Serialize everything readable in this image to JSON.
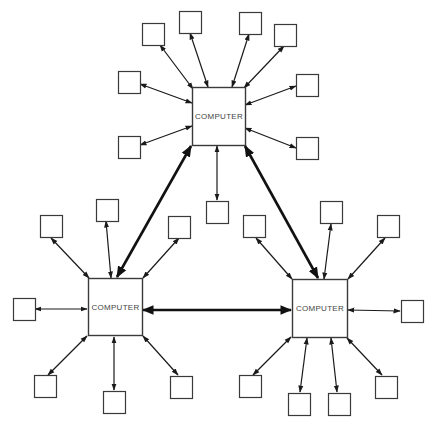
{
  "diagram": {
    "type": "distributed-computer-network",
    "colors": {
      "stroke": "#3a3a3a",
      "link": "#1a1a1a",
      "background": "#ffffff"
    },
    "computers": [
      {
        "id": "top",
        "label": "COMPUTER",
        "x": 192,
        "y": 87,
        "w": 53,
        "h": 58
      },
      {
        "id": "left",
        "label": "COMPUTER",
        "x": 88,
        "y": 278,
        "w": 54,
        "h": 57
      },
      {
        "id": "right",
        "label": "COMPUTER",
        "x": 292,
        "y": 279,
        "w": 55,
        "h": 58
      }
    ],
    "terminals": [
      {
        "hub": "top",
        "x": 142,
        "y": 23,
        "ax": 160,
        "ay": 45,
        "bx": 193,
        "by": 89
      },
      {
        "hub": "top",
        "x": 179,
        "y": 11,
        "ax": 190,
        "ay": 33,
        "bx": 208,
        "by": 87
      },
      {
        "hub": "top",
        "x": 239,
        "y": 12,
        "ax": 249,
        "ay": 34,
        "bx": 232,
        "by": 87
      },
      {
        "hub": "top",
        "x": 274,
        "y": 24,
        "ax": 284,
        "ay": 46,
        "bx": 244,
        "by": 88
      },
      {
        "hub": "top",
        "x": 118,
        "y": 71,
        "ax": 140,
        "ay": 84,
        "bx": 192,
        "by": 103
      },
      {
        "hub": "top",
        "x": 118,
        "y": 136,
        "ax": 140,
        "ay": 145,
        "bx": 192,
        "by": 126
      },
      {
        "hub": "top",
        "x": 296,
        "y": 74,
        "ax": 296,
        "ay": 86,
        "bx": 245,
        "by": 105
      },
      {
        "hub": "top",
        "x": 296,
        "y": 137,
        "ax": 296,
        "ay": 148,
        "bx": 245,
        "by": 128
      },
      {
        "hub": "top",
        "x": 206,
        "y": 201,
        "ax": 217,
        "ay": 200,
        "bx": 217,
        "by": 146
      },
      {
        "hub": "left",
        "x": 40,
        "y": 215,
        "ax": 51,
        "ay": 238,
        "bx": 89,
        "by": 278
      },
      {
        "hub": "left",
        "x": 96,
        "y": 199,
        "ax": 106,
        "ay": 221,
        "bx": 111,
        "by": 278
      },
      {
        "hub": "left",
        "x": 168,
        "y": 216,
        "ax": 179,
        "ay": 238,
        "bx": 143,
        "by": 278
      },
      {
        "hub": "left",
        "x": 13,
        "y": 298,
        "ax": 35,
        "ay": 309,
        "bx": 87,
        "by": 309
      },
      {
        "hub": "left",
        "x": 34,
        "y": 375,
        "ax": 48,
        "ay": 375,
        "bx": 87,
        "by": 336
      },
      {
        "hub": "left",
        "x": 103,
        "y": 391,
        "ax": 114,
        "ay": 390,
        "bx": 114,
        "by": 337
      },
      {
        "hub": "left",
        "x": 170,
        "y": 376,
        "ax": 178,
        "ay": 375,
        "bx": 143,
        "by": 336
      },
      {
        "hub": "right",
        "x": 243,
        "y": 215,
        "ax": 256,
        "ay": 238,
        "bx": 292,
        "by": 279
      },
      {
        "hub": "right",
        "x": 320,
        "y": 201,
        "ax": 331,
        "ay": 224,
        "bx": 324,
        "by": 279
      },
      {
        "hub": "right",
        "x": 377,
        "y": 215,
        "ax": 385,
        "ay": 238,
        "bx": 348,
        "by": 279
      },
      {
        "hub": "right",
        "x": 401,
        "y": 300,
        "ax": 400,
        "ay": 311,
        "bx": 348,
        "by": 310
      },
      {
        "hub": "right",
        "x": 239,
        "y": 375,
        "ax": 253,
        "ay": 375,
        "bx": 291,
        "by": 337
      },
      {
        "hub": "right",
        "x": 288,
        "y": 393,
        "ax": 300,
        "ay": 392,
        "bx": 307,
        "by": 338
      },
      {
        "hub": "right",
        "x": 328,
        "y": 393,
        "ax": 337,
        "ay": 392,
        "bx": 331,
        "by": 338
      },
      {
        "hub": "right",
        "x": 375,
        "y": 376,
        "ax": 382,
        "ay": 375,
        "bx": 347,
        "by": 338
      }
    ],
    "terminal_size": 22,
    "trunks": [
      {
        "from": "left",
        "to": "top",
        "x1": 117,
        "y1": 277,
        "x2": 191,
        "y2": 146
      },
      {
        "from": "top",
        "to": "right",
        "x1": 245,
        "y1": 146,
        "x2": 318,
        "y2": 278
      },
      {
        "from": "left",
        "to": "right",
        "x1": 143,
        "y1": 310,
        "x2": 291,
        "y2": 310
      }
    ]
  }
}
